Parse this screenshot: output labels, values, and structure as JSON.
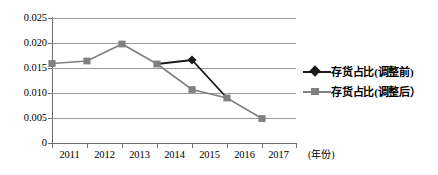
{
  "chart_data": {
    "type": "line",
    "title": "",
    "subtitle": "",
    "xlabel": "(年份)",
    "ylabel": "",
    "categories": [
      "2011",
      "2012",
      "2013",
      "2014",
      "2015",
      "2016",
      "2017"
    ],
    "ylim": [
      0,
      0.025
    ],
    "ytick_labels": [
      "0.025",
      "0.020",
      "0.015",
      "0.010",
      "0.005",
      "0"
    ],
    "ytick_values": [
      0.025,
      0.02,
      0.015,
      0.01,
      0.005,
      0
    ],
    "grid": "horizontal",
    "legend_position": "right",
    "series": [
      {
        "name": "存货占比(调整前)",
        "color": "#1a1a1a",
        "marker": "diamond",
        "x": [
          "2014",
          "2015",
          "2016"
        ],
        "values": [
          0.0158,
          0.0166,
          0.009
        ]
      },
      {
        "name": "存货占比(调整后）",
        "color": "#808080",
        "marker": "square",
        "x": [
          "2011",
          "2012",
          "2013",
          "2014",
          "2015",
          "2016",
          "2017"
        ],
        "values": [
          0.0159,
          0.0164,
          0.0198,
          0.0158,
          0.0107,
          0.009,
          0.0049
        ]
      }
    ]
  },
  "axes": {
    "y_ticks": [
      {
        "label": "0.025",
        "value": 0.025
      },
      {
        "label": "0.020",
        "value": 0.02
      },
      {
        "label": "0.015",
        "value": 0.015
      },
      {
        "label": "0.010",
        "value": 0.01
      },
      {
        "label": "0.005",
        "value": 0.005
      },
      {
        "label": "0",
        "value": 0
      }
    ],
    "x_ticks": [
      {
        "label": "2011"
      },
      {
        "label": "2012"
      },
      {
        "label": "2013"
      },
      {
        "label": "2014"
      },
      {
        "label": "2015"
      },
      {
        "label": "2016"
      },
      {
        "label": "2017"
      }
    ],
    "x_axis_title": "(年份)"
  },
  "legend": {
    "items": [
      {
        "label": "存货占比(调整前)",
        "color": "#1a1a1a",
        "marker": "diamond-icon"
      },
      {
        "label": "存货占比(调整后）",
        "color": "#808080",
        "marker": "square-icon"
      }
    ]
  },
  "colors": {
    "before_adjust": "#1a1a1a",
    "after_adjust": "#808080",
    "gridline": "#9a9a9a",
    "axis": "#6d6d6d",
    "background": "#ffffff"
  }
}
